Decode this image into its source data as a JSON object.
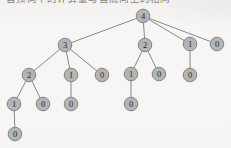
{
  "figure": {
    "caption_above": "自顶向下的计算量与自底向上的相同",
    "background_color": "#f6f5f3",
    "node_fill": "#b4b4b4",
    "node_stroke": "#7c7c7c",
    "edge_color": "#6b6b6b",
    "label_color": "#2b2b2b",
    "node_radius": 6.8
  },
  "chart_data": {
    "type": "diagram",
    "diagram_kind": "recursion-tree",
    "title": "",
    "nodes": [
      {
        "id": "n0",
        "label": "4",
        "x": 143,
        "y": 16,
        "depth": 0
      },
      {
        "id": "n1",
        "label": "3",
        "x": 65,
        "y": 45,
        "depth": 1
      },
      {
        "id": "n2",
        "label": "2",
        "x": 145,
        "y": 45,
        "depth": 1
      },
      {
        "id": "n3",
        "label": "1",
        "x": 190,
        "y": 44,
        "depth": 1
      },
      {
        "id": "n4",
        "label": "0",
        "x": 217,
        "y": 44,
        "depth": 1
      },
      {
        "id": "n5",
        "label": "2",
        "x": 29,
        "y": 75,
        "depth": 2
      },
      {
        "id": "n6",
        "label": "1",
        "x": 71,
        "y": 75,
        "depth": 2
      },
      {
        "id": "n7",
        "label": "0",
        "x": 102,
        "y": 75,
        "depth": 2
      },
      {
        "id": "n8",
        "label": "1",
        "x": 131,
        "y": 74,
        "depth": 2
      },
      {
        "id": "n9",
        "label": "0",
        "x": 159,
        "y": 74,
        "depth": 2
      },
      {
        "id": "n10",
        "label": "0",
        "x": 190,
        "y": 75,
        "depth": 2
      },
      {
        "id": "n11",
        "label": "1",
        "x": 14,
        "y": 104,
        "depth": 3
      },
      {
        "id": "n12",
        "label": "0",
        "x": 43,
        "y": 104,
        "depth": 3
      },
      {
        "id": "n13",
        "label": "0",
        "x": 71,
        "y": 104,
        "depth": 3
      },
      {
        "id": "n14",
        "label": "0",
        "x": 131,
        "y": 104,
        "depth": 3
      },
      {
        "id": "n15",
        "label": "0",
        "x": 15,
        "y": 134,
        "depth": 4
      }
    ],
    "edges": [
      {
        "from": "n0",
        "to": "n1"
      },
      {
        "from": "n0",
        "to": "n2"
      },
      {
        "from": "n0",
        "to": "n3"
      },
      {
        "from": "n0",
        "to": "n4"
      },
      {
        "from": "n1",
        "to": "n5"
      },
      {
        "from": "n1",
        "to": "n6"
      },
      {
        "from": "n1",
        "to": "n7"
      },
      {
        "from": "n2",
        "to": "n8"
      },
      {
        "from": "n2",
        "to": "n9"
      },
      {
        "from": "n3",
        "to": "n10"
      },
      {
        "from": "n5",
        "to": "n11"
      },
      {
        "from": "n5",
        "to": "n12"
      },
      {
        "from": "n6",
        "to": "n13"
      },
      {
        "from": "n8",
        "to": "n14"
      },
      {
        "from": "n11",
        "to": "n15"
      }
    ],
    "node_count": 16,
    "edge_count": 15,
    "max_depth": 4
  }
}
